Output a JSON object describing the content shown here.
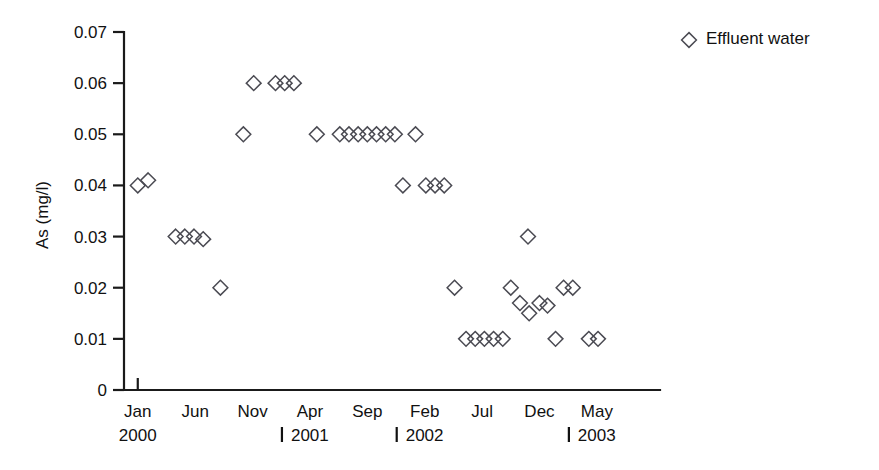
{
  "chart_data": {
    "type": "scatter",
    "title": "",
    "xlabel": "",
    "ylabel": "As (mg/l)",
    "ylim": [
      0,
      0.07
    ],
    "yticks": [
      "0",
      "0.01",
      "0.02",
      "0.03",
      "0.04",
      "0.05",
      "0.06",
      "0.07"
    ],
    "ytick_values": [
      0,
      0.01,
      0.02,
      0.03,
      0.04,
      0.05,
      0.06,
      0.07
    ],
    "grid": false,
    "legend_position": "top-right",
    "legend": [
      {
        "name": "Effluent water",
        "marker": "diamond"
      }
    ],
    "x_axis": {
      "months": [
        "Jan",
        "Jun",
        "Nov",
        "Apr",
        "Sep",
        "Feb",
        "Jul",
        "Dec",
        "May"
      ],
      "month_index": [
        0,
        5,
        10,
        15,
        20,
        25,
        30,
        35,
        40
      ],
      "years": [
        {
          "label": "2000",
          "month_index": 0,
          "separator": false
        },
        {
          "label": "2001",
          "month_index": 15,
          "separator": true
        },
        {
          "label": "2002",
          "month_index": 25,
          "separator": true
        },
        {
          "label": "2003",
          "month_index": 40,
          "separator": true
        }
      ],
      "range": [
        -1.2,
        45.5
      ]
    },
    "series": [
      {
        "name": "Effluent water",
        "marker": "diamond",
        "points": [
          {
            "x": 0.0,
            "y": 0.04
          },
          {
            "x": 0.9,
            "y": 0.041
          },
          {
            "x": 3.3,
            "y": 0.03
          },
          {
            "x": 4.1,
            "y": 0.03
          },
          {
            "x": 4.9,
            "y": 0.03
          },
          {
            "x": 5.7,
            "y": 0.0295
          },
          {
            "x": 7.2,
            "y": 0.02
          },
          {
            "x": 9.2,
            "y": 0.05
          },
          {
            "x": 10.1,
            "y": 0.06
          },
          {
            "x": 12.0,
            "y": 0.06
          },
          {
            "x": 12.8,
            "y": 0.06
          },
          {
            "x": 13.6,
            "y": 0.06
          },
          {
            "x": 15.6,
            "y": 0.05
          },
          {
            "x": 17.6,
            "y": 0.05
          },
          {
            "x": 18.4,
            "y": 0.05
          },
          {
            "x": 19.2,
            "y": 0.05
          },
          {
            "x": 20.0,
            "y": 0.05
          },
          {
            "x": 20.8,
            "y": 0.05
          },
          {
            "x": 21.6,
            "y": 0.05
          },
          {
            "x": 22.4,
            "y": 0.05
          },
          {
            "x": 24.2,
            "y": 0.05
          },
          {
            "x": 23.1,
            "y": 0.04
          },
          {
            "x": 25.1,
            "y": 0.04
          },
          {
            "x": 25.9,
            "y": 0.04
          },
          {
            "x": 26.7,
            "y": 0.04
          },
          {
            "x": 27.6,
            "y": 0.02
          },
          {
            "x": 28.6,
            "y": 0.01
          },
          {
            "x": 29.4,
            "y": 0.01
          },
          {
            "x": 30.2,
            "y": 0.01
          },
          {
            "x": 31.0,
            "y": 0.01
          },
          {
            "x": 31.8,
            "y": 0.01
          },
          {
            "x": 32.5,
            "y": 0.02
          },
          {
            "x": 34.0,
            "y": 0.03
          },
          {
            "x": 33.3,
            "y": 0.017
          },
          {
            "x": 34.1,
            "y": 0.015
          },
          {
            "x": 35.0,
            "y": 0.017
          },
          {
            "x": 35.7,
            "y": 0.0165
          },
          {
            "x": 37.1,
            "y": 0.02
          },
          {
            "x": 37.9,
            "y": 0.02
          },
          {
            "x": 36.4,
            "y": 0.01
          },
          {
            "x": 39.3,
            "y": 0.01
          },
          {
            "x": 40.1,
            "y": 0.01
          }
        ]
      }
    ]
  },
  "colors": {
    "marker_stroke": "#4a4a52",
    "axis": "#1a1a1a",
    "text": "#111111",
    "background": "#ffffff"
  }
}
